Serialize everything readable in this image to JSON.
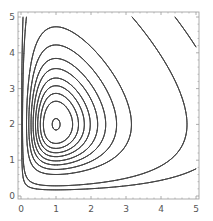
{
  "chart_data": {
    "type": "contour",
    "title": "",
    "xlabel": "",
    "ylabel": "",
    "function": "x - ln(x) + y - 2*ln(y)",
    "center": [
      1,
      2
    ],
    "xlim": [
      0,
      5
    ],
    "ylim": [
      0,
      5
    ],
    "grid": false,
    "legend": null,
    "x_ticks": [
      "0",
      "1",
      "2",
      "3",
      "4",
      "5"
    ],
    "y_ticks": [
      "0",
      "1",
      "2",
      "3",
      "4",
      "5"
    ],
    "contour_levels": [
      1.62,
      1.7,
      1.76,
      1.83,
      1.91,
      2.02,
      2.15,
      2.34,
      2.62,
      3.8,
      4.7
    ],
    "line_color": "#444444",
    "frame_color": "#999999"
  },
  "layout": {
    "frame": {
      "left": 18,
      "top": 12,
      "right": 199,
      "bottom": 199
    },
    "x_origin_px": 21,
    "x_unit_px": 35,
    "y_origin_px": 196,
    "y_unit_px": 35.8
  }
}
